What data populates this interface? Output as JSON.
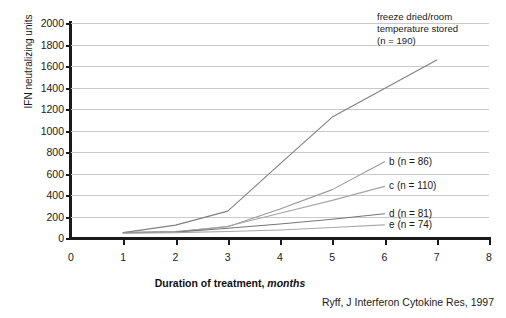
{
  "chart_data": {
    "type": "line",
    "title": "",
    "xlabel": "Duration of treatment, months",
    "xlabel_plain": "Duration of treatment,",
    "xlabel_italic": "months",
    "ylabel": "IFN neutralizing units",
    "xlim": [
      0,
      8
    ],
    "ylim": [
      0,
      2000
    ],
    "xticks": [
      "0",
      "1",
      "2",
      "3",
      "4",
      "5",
      "6",
      "7",
      "8"
    ],
    "yticks": [
      "0",
      "200",
      "400",
      "600",
      "800",
      "1000",
      "1200",
      "1400",
      "1600",
      "1800",
      "2000"
    ],
    "grid": "horizontal",
    "legend_position": "inline-right",
    "annotation": "freeze dried/room\ntemperature stored\n(n = 190)",
    "series": [
      {
        "name": "freeze dried/room temperature stored (n = 190)",
        "label": "a",
        "n": 190,
        "color": "#808080",
        "x": [
          1,
          2,
          3,
          4,
          5,
          6,
          7
        ],
        "values": [
          50,
          120,
          250,
          690,
          1125,
          1390,
          1655
        ]
      },
      {
        "name": "b (n = 86)",
        "label": "b",
        "n": 86,
        "color": "#9a9a9a",
        "x": [
          1,
          2,
          3,
          4,
          5,
          6
        ],
        "values": [
          50,
          60,
          105,
          270,
          450,
          710
        ]
      },
      {
        "name": "c (n = 110)",
        "label": "c",
        "n": 110,
        "color": "#a5a5a5",
        "x": [
          1,
          2,
          3,
          4,
          5,
          6
        ],
        "values": [
          50,
          55,
          110,
          230,
          350,
          480
        ]
      },
      {
        "name": "d (n = 81)",
        "label": "d",
        "n": 81,
        "color": "#777777",
        "x": [
          1,
          2,
          3,
          4,
          5,
          6
        ],
        "values": [
          50,
          55,
          90,
          130,
          175,
          225
        ]
      },
      {
        "name": "e (n = 74)",
        "label": "e",
        "n": 74,
        "color": "#a8a8a8",
        "x": [
          1,
          2,
          3,
          4,
          5,
          6
        ],
        "values": [
          45,
          50,
          60,
          75,
          98,
          122
        ]
      }
    ],
    "series_labels": [
      {
        "text": "b (n = 86)",
        "x": 6.05,
        "y": 710
      },
      {
        "text": "c (n = 110)",
        "x": 6.05,
        "y": 480
      },
      {
        "text": "d (n = 81)",
        "x": 6.05,
        "y": 225
      },
      {
        "text": "e (n = 74)",
        "x": 6.05,
        "y": 122
      }
    ]
  },
  "citation": "Ryff, J Interferon Cytokine Res, 1997"
}
